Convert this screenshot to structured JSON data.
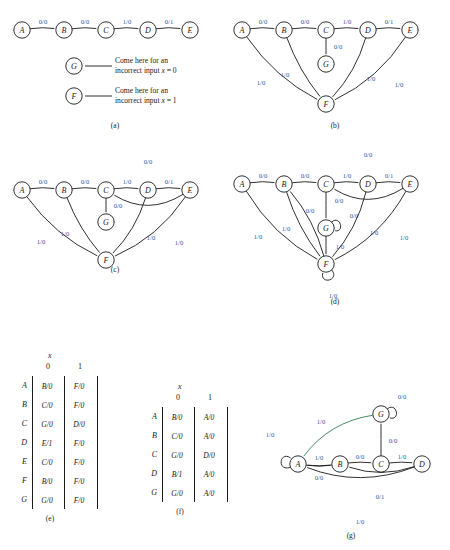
{
  "figure": {
    "background": "#ffffff",
    "label_color": "#2a5aa8",
    "edge_color": "#1a1a1a",
    "green_edge_color": "#2f7d4f"
  },
  "panels": {
    "a": {
      "caption": "(a)",
      "states": [
        "A",
        "B",
        "C",
        "D",
        "E",
        "G",
        "F"
      ],
      "edges": [
        {
          "from": "A",
          "to": "B",
          "label": "0/0"
        },
        {
          "from": "B",
          "to": "C",
          "label": "0/0"
        },
        {
          "from": "C",
          "to": "D",
          "label": "1/0"
        },
        {
          "from": "D",
          "to": "E",
          "label": "0/1"
        }
      ],
      "notes": [
        {
          "target": "G",
          "line1": "Come here for an",
          "line2_pre": "incorrect input ",
          "line2_var": "x",
          "line2_post": " = 0"
        },
        {
          "target": "F",
          "line1": "Come here for an",
          "line2_pre": "incorrect input ",
          "line2_var": "x",
          "line2_post": " = 1"
        }
      ]
    },
    "b": {
      "caption": "(b)",
      "states": [
        "A",
        "B",
        "C",
        "D",
        "E",
        "G",
        "F"
      ],
      "edges": [
        {
          "from": "A",
          "to": "B",
          "label": "0/0"
        },
        {
          "from": "B",
          "to": "C",
          "label": "0/0"
        },
        {
          "from": "C",
          "to": "D",
          "label": "1/0"
        },
        {
          "from": "D",
          "to": "E",
          "label": "0/1"
        },
        {
          "from": "C",
          "to": "G",
          "label": "0/0"
        },
        {
          "from": "A",
          "to": "F",
          "label": "1/0"
        },
        {
          "from": "B",
          "to": "F",
          "label": "1/0"
        },
        {
          "from": "D",
          "to": "F",
          "label": "1/0"
        },
        {
          "from": "E",
          "to": "F",
          "label": "1/0"
        }
      ]
    },
    "c": {
      "caption": "(c)",
      "states": [
        "A",
        "B",
        "C",
        "D",
        "E",
        "G",
        "F"
      ],
      "edges": [
        {
          "from": "A",
          "to": "B",
          "label": "0/0"
        },
        {
          "from": "B",
          "to": "C",
          "label": "0/0"
        },
        {
          "from": "C",
          "to": "D",
          "label": "1/0"
        },
        {
          "from": "D",
          "to": "E",
          "label": "0/1"
        },
        {
          "from": "E",
          "to": "C",
          "label": "0/0"
        },
        {
          "from": "C",
          "to": "G",
          "label": "0/0"
        },
        {
          "from": "A",
          "to": "F",
          "label": "1/0"
        },
        {
          "from": "B",
          "to": "F",
          "label": "1/0"
        },
        {
          "from": "D",
          "to": "F",
          "label": "1/0"
        },
        {
          "from": "E",
          "to": "F",
          "label": "1/0"
        }
      ]
    },
    "d": {
      "caption": "(d)",
      "states": [
        "A",
        "B",
        "C",
        "D",
        "E",
        "G",
        "F"
      ],
      "edges": [
        {
          "from": "A",
          "to": "B",
          "label": "0/0"
        },
        {
          "from": "B",
          "to": "C",
          "label": "0/0"
        },
        {
          "from": "C",
          "to": "D",
          "label": "1/0"
        },
        {
          "from": "D",
          "to": "E",
          "label": "0/1"
        },
        {
          "from": "E",
          "to": "C",
          "label": "0/0"
        },
        {
          "from": "C",
          "to": "G",
          "label": "0/0"
        },
        {
          "from": "G",
          "to": "G",
          "label": "0/0"
        },
        {
          "from": "G",
          "to": "F",
          "label": "1/0"
        },
        {
          "from": "F",
          "to": "B",
          "label": "0/0"
        },
        {
          "from": "F",
          "to": "F",
          "label": "1/0"
        },
        {
          "from": "A",
          "to": "F",
          "label": "1/0"
        },
        {
          "from": "B",
          "to": "F",
          "label": "1/0"
        },
        {
          "from": "D",
          "to": "F",
          "label": "1/0"
        },
        {
          "from": "E",
          "to": "F",
          "label": "1/0"
        }
      ]
    },
    "g": {
      "caption": "(g)",
      "states": [
        "A",
        "B",
        "C",
        "D",
        "G"
      ],
      "edges": [
        {
          "from": "A",
          "to": "A",
          "label": "1/0"
        },
        {
          "from": "A",
          "to": "B",
          "label": "0/0"
        },
        {
          "from": "B",
          "to": "C",
          "label": "0/0"
        },
        {
          "from": "C",
          "to": "D",
          "label": "1/0"
        },
        {
          "from": "C",
          "to": "G",
          "label": "0/0"
        },
        {
          "from": "G",
          "to": "G",
          "label": "0/0"
        },
        {
          "from": "G",
          "to": "A",
          "label": "1/0"
        },
        {
          "from": "B",
          "to": "A",
          "label": "1/0"
        },
        {
          "from": "D",
          "to": "B",
          "label": "0/1"
        },
        {
          "from": "D",
          "to": "A",
          "label": "1/0"
        }
      ]
    }
  },
  "table_e": {
    "caption": "(e)",
    "input_var": "x",
    "columns": [
      "0",
      "1"
    ],
    "rows": [
      {
        "state": "A",
        "next": [
          "B/0",
          "F/0"
        ]
      },
      {
        "state": "B",
        "next": [
          "C/0",
          "F/0"
        ]
      },
      {
        "state": "C",
        "next": [
          "G/0",
          "D/0"
        ]
      },
      {
        "state": "D",
        "next": [
          "E/1",
          "F/0"
        ]
      },
      {
        "state": "E",
        "next": [
          "C/0",
          "F/0"
        ]
      },
      {
        "state": "F",
        "next": [
          "B/0",
          "F/0"
        ]
      },
      {
        "state": "G",
        "next": [
          "G/0",
          "F/0"
        ]
      }
    ]
  },
  "table_f": {
    "caption": "(f)",
    "input_var": "x",
    "columns": [
      "0",
      "1"
    ],
    "rows": [
      {
        "state": "A",
        "next": [
          "B/0",
          "A/0"
        ]
      },
      {
        "state": "B",
        "next": [
          "C/0",
          "A/0"
        ]
      },
      {
        "state": "C",
        "next": [
          "G/0",
          "D/0"
        ]
      },
      {
        "state": "D",
        "next": [
          "B/1",
          "A/0"
        ]
      },
      {
        "state": "G",
        "next": [
          "G/0",
          "A/0"
        ]
      }
    ]
  }
}
